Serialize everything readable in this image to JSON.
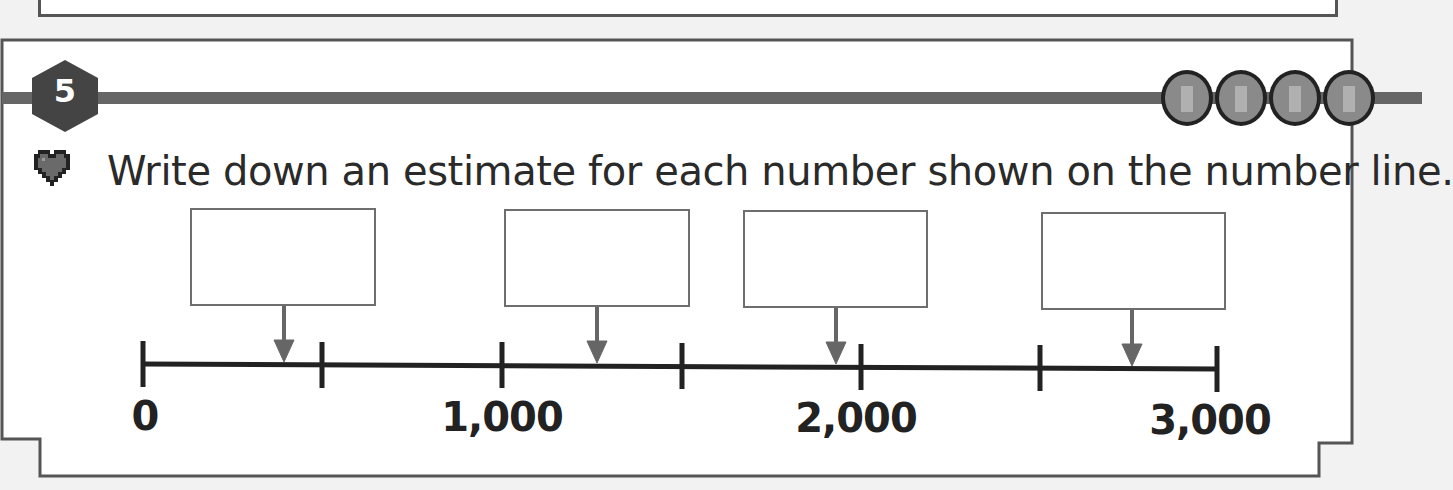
{
  "question": {
    "number": "5",
    "difficulty_gems": 4,
    "prompt_icon": "heart-icon",
    "prompt": "Write down an estimate for each number shown on the number line."
  },
  "number_line": {
    "min": 0,
    "max": 3000,
    "tick_interval": 500,
    "labels": [
      {
        "value": 0,
        "text": "0"
      },
      {
        "value": 1000,
        "text": "1,000"
      },
      {
        "value": 2000,
        "text": "2,000"
      },
      {
        "value": 3000,
        "text": "3,000"
      }
    ],
    "answer_boxes": [
      {
        "id": "a",
        "value": ""
      },
      {
        "id": "b",
        "value": ""
      },
      {
        "id": "c",
        "value": ""
      },
      {
        "id": "d",
        "value": ""
      }
    ]
  },
  "colors": {
    "badge": "#444444",
    "rule": "#666666",
    "gem": "#8a8a8a",
    "heart": "#6a6a6a",
    "arrow": "#666666",
    "line": "#222222"
  }
}
